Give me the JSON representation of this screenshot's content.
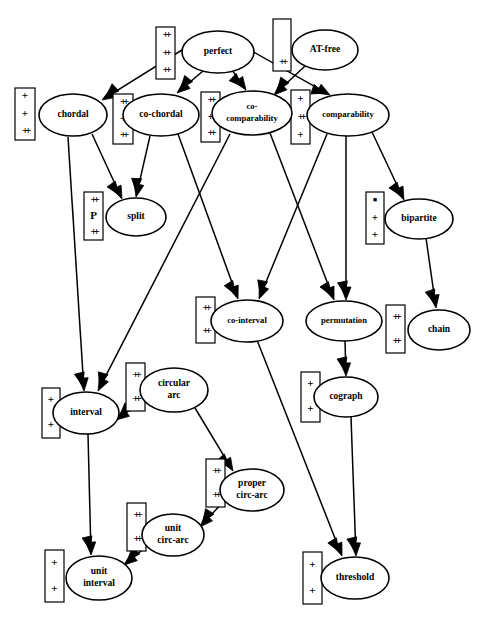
{
  "diagram": {
    "type": "directed-graph",
    "width": 489,
    "height": 628,
    "stroke_color": "#000000",
    "fill_color": "#ffffff"
  },
  "nodes": [
    {
      "id": "perfect",
      "label": "perfect",
      "label2": "",
      "cx": 218,
      "cy": 52,
      "rx": 36,
      "ry": 21
    },
    {
      "id": "at-free",
      "label": "AT-free",
      "label2": "",
      "cx": 325,
      "cy": 50,
      "rx": 33,
      "ry": 20
    },
    {
      "id": "chordal",
      "label": "chordal",
      "label2": "",
      "cx": 73,
      "cy": 115,
      "rx": 34,
      "ry": 21
    },
    {
      "id": "co-chordal",
      "label": "co-chordal",
      "label2": "",
      "cx": 161,
      "cy": 115,
      "rx": 38,
      "ry": 21
    },
    {
      "id": "co-comparability",
      "label": "co-",
      "label2": "comparability",
      "cx": 252,
      "cy": 113,
      "rx": 40,
      "ry": 22
    },
    {
      "id": "comparability",
      "label": "comparability",
      "label2": "",
      "cx": 348,
      "cy": 115,
      "rx": 41,
      "ry": 21
    },
    {
      "id": "split",
      "label": "split",
      "label2": "",
      "cx": 136,
      "cy": 217,
      "rx": 30,
      "ry": 19
    },
    {
      "id": "bipartite",
      "label": "bipartite",
      "label2": "",
      "cx": 419,
      "cy": 219,
      "rx": 34,
      "ry": 20
    },
    {
      "id": "co-interval",
      "label": "co-interval",
      "label2": "",
      "cx": 247,
      "cy": 321,
      "rx": 36,
      "ry": 21
    },
    {
      "id": "permutation",
      "label": "permutation",
      "label2": "",
      "cx": 344,
      "cy": 321,
      "rx": 38,
      "ry": 20
    },
    {
      "id": "chain",
      "label": "chain",
      "label2": "",
      "cx": 439,
      "cy": 330,
      "rx": 31,
      "ry": 20
    },
    {
      "id": "circular-arc",
      "label": "circular",
      "label2": "arc",
      "cx": 174,
      "cy": 390,
      "rx": 34,
      "ry": 22
    },
    {
      "id": "interval",
      "label": "interval",
      "label2": "",
      "cx": 86,
      "cy": 413,
      "rx": 33,
      "ry": 21
    },
    {
      "id": "cograph",
      "label": "cograph",
      "label2": "",
      "cx": 346,
      "cy": 397,
      "rx": 32,
      "ry": 20
    },
    {
      "id": "proper-circ-arc",
      "label": "proper",
      "label2": "circ-arc",
      "cx": 252,
      "cy": 490,
      "rx": 32,
      "ry": 21
    },
    {
      "id": "unit-circ-arc",
      "label": "unit",
      "label2": "circ-arc",
      "cx": 173,
      "cy": 535,
      "rx": 31,
      "ry": 21
    },
    {
      "id": "unit-interval",
      "label": "unit",
      "label2": "interval",
      "cx": 99,
      "cy": 578,
      "rx": 33,
      "ry": 22
    },
    {
      "id": "threshold",
      "label": "threshold",
      "label2": "",
      "cx": 355,
      "cy": 578,
      "rx": 34,
      "ry": 21
    }
  ],
  "edges": [
    {
      "from": "perfect",
      "to": "chordal",
      "x1": 190,
      "y1": 45,
      "x2": 102,
      "y2": 100
    },
    {
      "from": "perfect",
      "to": "co-chordal",
      "x1": 203,
      "y1": 71,
      "x2": 177,
      "y2": 93
    },
    {
      "from": "perfect",
      "to": "co-comparability",
      "x1": 232,
      "y1": 70,
      "x2": 246,
      "y2": 90
    },
    {
      "from": "perfect",
      "to": "comparability",
      "x1": 250,
      "y1": 50,
      "x2": 330,
      "y2": 95
    },
    {
      "from": "at-free",
      "to": "co-comparability",
      "x1": 305,
      "y1": 66,
      "x2": 274,
      "y2": 95
    },
    {
      "from": "chordal",
      "to": "interval",
      "x1": 68,
      "y1": 137,
      "x2": 84,
      "y2": 391
    },
    {
      "from": "chordal",
      "to": "split",
      "x1": 92,
      "y1": 134,
      "x2": 122,
      "y2": 199
    },
    {
      "from": "co-chordal",
      "to": "split",
      "x1": 150,
      "y1": 136,
      "x2": 136,
      "y2": 197
    },
    {
      "from": "co-chordal",
      "to": "co-interval",
      "x1": 178,
      "y1": 134,
      "x2": 238,
      "y2": 299
    },
    {
      "from": "co-comparability",
      "to": "interval",
      "x1": 230,
      "y1": 134,
      "x2": 98,
      "y2": 391
    },
    {
      "from": "co-comparability",
      "to": "permutation",
      "x1": 270,
      "y1": 133,
      "x2": 334,
      "y2": 300
    },
    {
      "from": "comparability",
      "to": "co-interval",
      "x1": 327,
      "y1": 134,
      "x2": 259,
      "y2": 299
    },
    {
      "from": "comparability",
      "to": "permutation",
      "x1": 346,
      "y1": 136,
      "x2": 346,
      "y2": 300
    },
    {
      "from": "comparability",
      "to": "bipartite",
      "x1": 372,
      "y1": 132,
      "x2": 404,
      "y2": 200
    },
    {
      "from": "bipartite",
      "to": "chain",
      "x1": 426,
      "y1": 238,
      "x2": 436,
      "y2": 308
    },
    {
      "from": "permutation",
      "to": "cograph",
      "x1": 345,
      "y1": 341,
      "x2": 346,
      "y2": 376
    },
    {
      "from": "co-interval",
      "to": "threshold",
      "x1": 257,
      "y1": 340,
      "x2": 342,
      "y2": 556
    },
    {
      "from": "cograph",
      "to": "threshold",
      "x1": 351,
      "y1": 417,
      "x2": 356,
      "y2": 556
    },
    {
      "from": "circular-arc",
      "to": "interval",
      "x1": 143,
      "y1": 400,
      "x2": 116,
      "y2": 420
    },
    {
      "from": "circular-arc",
      "to": "proper-circ-arc",
      "x1": 195,
      "y1": 408,
      "x2": 233,
      "y2": 471
    },
    {
      "from": "interval",
      "to": "unit-interval",
      "x1": 88,
      "y1": 434,
      "x2": 91,
      "y2": 555
    },
    {
      "from": "proper-circ-arc",
      "to": "unit-circ-arc",
      "x1": 224,
      "y1": 501,
      "x2": 200,
      "y2": 527
    },
    {
      "from": "unit-circ-arc",
      "to": "unit-interval",
      "x1": 146,
      "y1": 547,
      "x2": 124,
      "y2": 565
    }
  ],
  "annotations": [
    {
      "id": "anno-chordal-left",
      "for": "chordal",
      "x": 15,
      "y": 88,
      "w": 20,
      "h": 52,
      "symbols": [
        "+",
        "+",
        "++"
      ]
    },
    {
      "id": "anno-chordal-right",
      "for": "chordal",
      "x": 113,
      "y": 94,
      "w": 20,
      "h": 50,
      "symbols": [
        "++",
        "++",
        "++"
      ]
    },
    {
      "id": "anno-perfect-left",
      "for": "perfect",
      "x": 156,
      "y": 27,
      "w": 19,
      "h": 52,
      "symbols": [
        "++",
        "++",
        "++"
      ]
    },
    {
      "id": "anno-atfree-left",
      "for": "at-free",
      "x": 273,
      "y": 19,
      "w": 18,
      "h": 52,
      "symbols": [
        "",
        "",
        "++"
      ]
    },
    {
      "id": "anno-cocomp-left",
      "for": "co-comparability",
      "x": 201,
      "y": 92,
      "w": 19,
      "h": 50,
      "symbols": [
        "++",
        "++",
        "++"
      ]
    },
    {
      "id": "anno-cocomp-right",
      "for": "co-comparability",
      "x": 291,
      "y": 90,
      "w": 19,
      "h": 54,
      "symbols": [
        "+",
        "++",
        "+"
      ]
    },
    {
      "id": "anno-split-left",
      "for": "split",
      "x": 84,
      "y": 192,
      "w": 19,
      "h": 48,
      "symbols": [
        "++",
        "P",
        "++"
      ]
    },
    {
      "id": "anno-bipartite-left",
      "for": "bipartite",
      "x": 366,
      "y": 192,
      "w": 18,
      "h": 52,
      "symbols": [
        "▪",
        "+",
        "+"
      ]
    },
    {
      "id": "anno-cointerval-left",
      "for": "co-interval",
      "x": 196,
      "y": 297,
      "w": 19,
      "h": 46,
      "symbols": [
        "++",
        "++"
      ]
    },
    {
      "id": "anno-permutation-right",
      "for": "permutation",
      "x": 386,
      "y": 305,
      "w": 19,
      "h": 48,
      "symbols": [
        "++",
        "++"
      ]
    },
    {
      "id": "anno-interval-left",
      "for": "interval",
      "x": 42,
      "y": 388,
      "w": 18,
      "h": 50,
      "symbols": [
        "+",
        "+"
      ]
    },
    {
      "id": "anno-interval-right",
      "for": "interval",
      "x": 126,
      "y": 363,
      "w": 19,
      "h": 48,
      "symbols": [
        "++",
        "++"
      ]
    },
    {
      "id": "anno-cograph-left",
      "for": "cograph",
      "x": 301,
      "y": 372,
      "w": 19,
      "h": 50,
      "symbols": [
        "+",
        "+"
      ]
    },
    {
      "id": "anno-propercircarc-left",
      "for": "proper-circ-arc",
      "x": 206,
      "y": 459,
      "w": 19,
      "h": 48,
      "symbols": [
        "++",
        "++"
      ]
    },
    {
      "id": "anno-unitcircarc-left",
      "for": "unit-circ-arc",
      "x": 127,
      "y": 503,
      "w": 19,
      "h": 48,
      "symbols": [
        "++",
        "++"
      ]
    },
    {
      "id": "anno-unitinterval-left",
      "for": "unit-interval",
      "x": 45,
      "y": 550,
      "w": 19,
      "h": 52,
      "symbols": [
        "+",
        "+"
      ]
    },
    {
      "id": "anno-threshold-left",
      "for": "threshold",
      "x": 303,
      "y": 552,
      "w": 19,
      "h": 52,
      "symbols": [
        "+",
        "+"
      ]
    }
  ]
}
